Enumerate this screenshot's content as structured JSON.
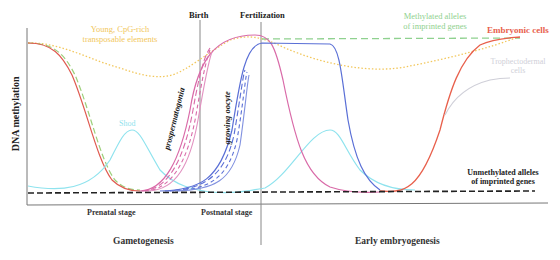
{
  "figure": {
    "y_axis_label": "DNA methylation",
    "event_labels": {
      "birth": "Birth",
      "fertilization": "Fertilization"
    },
    "stage_labels": {
      "prenatal": "Prenatal stage",
      "postnatal": "Postnatal stage"
    },
    "phase_labels": {
      "gametogenesis": "Gametogenesis",
      "early_embryogenesis": "Early embryogenesis"
    },
    "curve_labels": {
      "transposable_line1": "Young, CpG-rich",
      "transposable_line2": "transposable elements",
      "methylated_line1": "Methylated alleles",
      "methylated_line2": "of imprinted genes",
      "embryonic": "Embryonic cells",
      "trophectoderm_line1": "Trophectodermal",
      "trophectoderm_line2": "cells",
      "shod": "Shod",
      "prospermatogonia": "prospermatogonia",
      "growing_oocyte": "growing oocyte",
      "unmethylated_line1": "Unmethylated alleles",
      "unmethylated_line2": "of imprinted genes"
    },
    "colors": {
      "axis": "#555555",
      "text": "#222222",
      "transposable": "#f2c75c",
      "methylated_imprinted": "#8fd18f",
      "embryonic": "#e8604c",
      "trophectoderm": "#cfcfd8",
      "shod": "#8fe3ee",
      "prospermatogonia": "#d96aa8",
      "growing_oocyte": "#5a6fd6",
      "germline_green": "#9ccf7a",
      "germline_red": "#e05a50",
      "unmethylated": "#222222"
    }
  }
}
